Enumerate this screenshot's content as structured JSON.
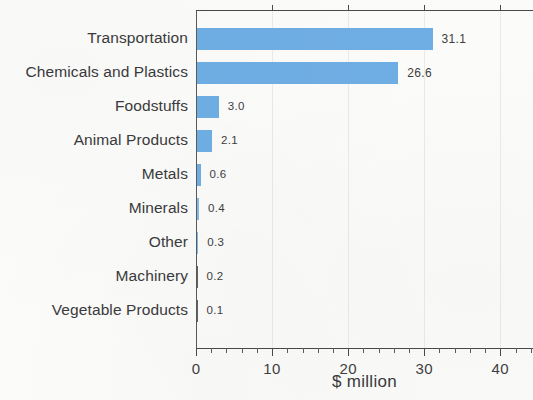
{
  "chart_data": {
    "type": "bar",
    "orientation": "horizontal",
    "title": "",
    "subtitle": "",
    "xlabel": "$ million",
    "ylabel": "",
    "categories": [
      "Transportation",
      "Chemicals and Plastics",
      "Foodstuffs",
      "Animal Products",
      "Metals",
      "Minerals",
      "Other",
      "Machinery",
      "Vegetable Products"
    ],
    "values": [
      31.1,
      26.6,
      3.0,
      2.1,
      0.6,
      0.4,
      0.3,
      0.2,
      0.1
    ],
    "value_labels": [
      "31.1",
      "26.6",
      "3.0",
      "2.1",
      "0.6",
      "0.4",
      "0.3",
      "0.2",
      "0.1"
    ],
    "xlim": [
      0,
      44.3
    ],
    "xticks": [
      0,
      10,
      20,
      30,
      40
    ],
    "xtick_labels": [
      "0",
      "10",
      "20",
      "30",
      "40"
    ],
    "minor_tick_interval": 2,
    "grid": "faint-vertical-at-major-ticks",
    "legend": "none",
    "bar_color": "#6bace4",
    "axis_color": "#4a4a4a",
    "text_color": "#3a3a3a",
    "background_color": "#fbfbfa"
  }
}
